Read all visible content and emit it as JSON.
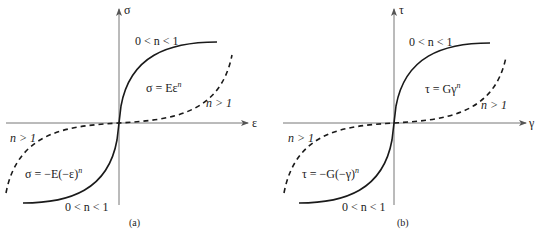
{
  "figure": {
    "panels": [
      {
        "id": "a",
        "caption": "(a)",
        "y_axis_label": "σ",
        "x_axis_label": "ε",
        "upper_range_label": "0 < n < 1",
        "upper_equation": "σ = Eε",
        "upper_equation_exp": "n",
        "upper_dashed_label": "n > 1",
        "lower_dashed_label": "n > 1",
        "lower_equation": "σ = −E(−ε)",
        "lower_equation_exp": "n",
        "lower_range_label": "0 < n < 1"
      },
      {
        "id": "b",
        "caption": "(b)",
        "y_axis_label": "τ",
        "x_axis_label": "γ",
        "upper_range_label": "0 < n < 1",
        "upper_equation": "τ = Gγ",
        "upper_equation_exp": "n",
        "upper_dashed_label": "n > 1",
        "lower_dashed_label": "n > 1",
        "lower_equation": "τ = −G(−γ)",
        "lower_equation_exp": "n",
        "lower_range_label": "0 < n < 1"
      }
    ],
    "legend": {
      "solid_line": "0 < n < 1",
      "dashed_line": "n > 1"
    },
    "colors": {
      "line": "#1a1a1a",
      "axis": "#555555",
      "background": "#ffffff"
    }
  }
}
